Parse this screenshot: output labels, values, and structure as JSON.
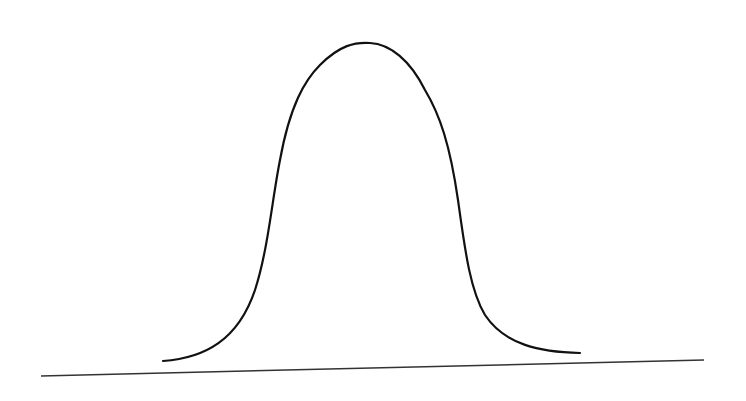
{
  "diagram": {
    "type": "bell-curve",
    "colors": {
      "background": "#ffffff",
      "curve": "#111111",
      "baseline": "#333333"
    },
    "curve": {
      "start": [
        163,
        361
      ],
      "peak": [
        370,
        43
      ],
      "end": [
        580,
        353
      ]
    },
    "baseline": {
      "start": [
        41,
        376
      ],
      "end": [
        704,
        360
      ]
    }
  }
}
